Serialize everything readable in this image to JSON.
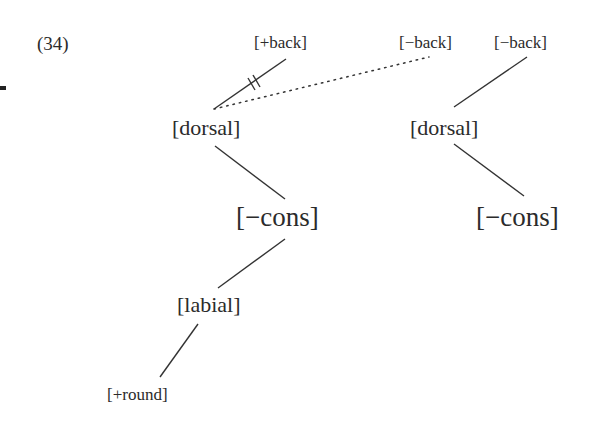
{
  "example_number": "(34)",
  "colors": {
    "text": "#2b2b2b",
    "line": "#333333",
    "background": "#ffffff"
  },
  "left_tree": {
    "top_features": {
      "plus_back": "[+back]",
      "minus_back_spread": "[−back]"
    },
    "dorsal": "[dorsal]",
    "cons": "[−cons]",
    "labial": "[labial]",
    "round": "[+round]",
    "delinking_mark": "double-bar (delinked association)",
    "spreading_link": "dotted (new association)"
  },
  "right_tree": {
    "back": "[−back]",
    "dorsal": "[dorsal]",
    "cons": "[−cons]"
  }
}
